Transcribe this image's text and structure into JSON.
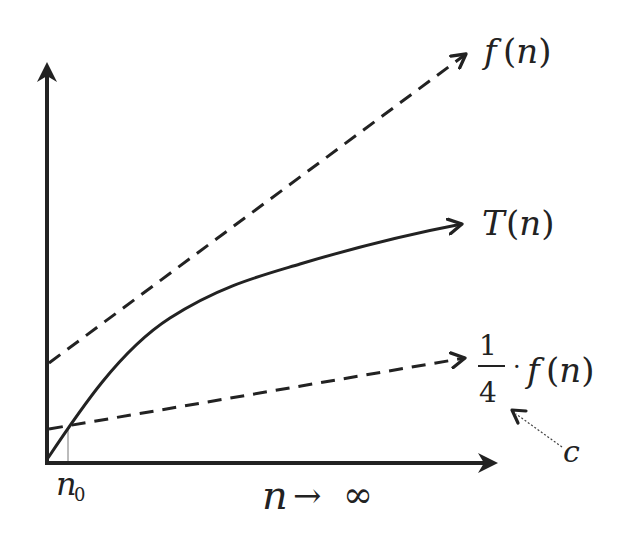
{
  "diagram": {
    "curves": [
      {
        "id": "f",
        "label_fn": "f",
        "label_arg": "(n)",
        "style": "dashed",
        "description": "upper bound f(n)"
      },
      {
        "id": "T",
        "label_fn": "T",
        "label_arg": "(n)",
        "style": "solid",
        "description": "running time T(n)"
      },
      {
        "id": "cf",
        "label_num": "1",
        "label_den": "4",
        "label_dot": "·",
        "label_fn": "f",
        "label_arg": "(n)",
        "style": "dashed",
        "description": "scaled bound c·f(n) with c = 1/4"
      }
    ],
    "annotations": {
      "constant_label": "c",
      "threshold_label": "n",
      "threshold_subscript": "0",
      "x_axis_label_var": "n",
      "x_axis_label_arrow": "→",
      "x_axis_label_inf": "∞"
    },
    "colors": {
      "ink": "#222222",
      "background": "#ffffff"
    }
  }
}
